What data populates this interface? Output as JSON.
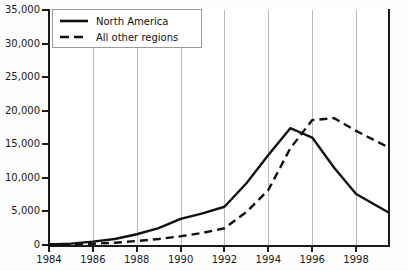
{
  "chart_data": {
    "type": "line",
    "title": "",
    "xlabel": "",
    "ylabel": "",
    "xlim": [
      1984,
      1999.5
    ],
    "ylim": [
      0,
      35000
    ],
    "grid": "vertical",
    "legend_position": "top-left",
    "x_tick_labels": [
      "1984",
      "1986",
      "1988",
      "1990",
      "1992",
      "1994",
      "1996",
      "1998"
    ],
    "x_ticks": [
      1984,
      1986,
      1988,
      1990,
      1992,
      1994,
      1996,
      1998
    ],
    "y_tick_labels": [
      "0",
      "5,000",
      "10,000",
      "15,000",
      "20,000",
      "25,000",
      "30,000",
      "35,000"
    ],
    "y_ticks": [
      0,
      5000,
      10000,
      15000,
      20000,
      25000,
      30000,
      35000
    ],
    "x": [
      1984,
      1985,
      1986,
      1987,
      1988,
      1989,
      1990,
      1991,
      1992,
      1993,
      1994,
      1995,
      1996,
      1997,
      1998,
      1999.5
    ],
    "series": [
      {
        "name": "North America",
        "style": "solid",
        "color": "#111111",
        "values": [
          100,
          200,
          500,
          900,
          1600,
          2500,
          3900,
          4700,
          5700,
          9200,
          13400,
          17400,
          16000,
          11500,
          7600,
          4800
        ]
      },
      {
        "name": "All other regions",
        "style": "dashed",
        "color": "#111111",
        "values": [
          50,
          90,
          180,
          330,
          600,
          900,
          1300,
          1800,
          2500,
          4900,
          8200,
          14400,
          18600,
          18900,
          17000,
          14500
        ]
      }
    ]
  },
  "legend": {
    "items": [
      {
        "label": "North America",
        "style": "solid"
      },
      {
        "label": "All other regions",
        "style": "dashed"
      }
    ]
  }
}
